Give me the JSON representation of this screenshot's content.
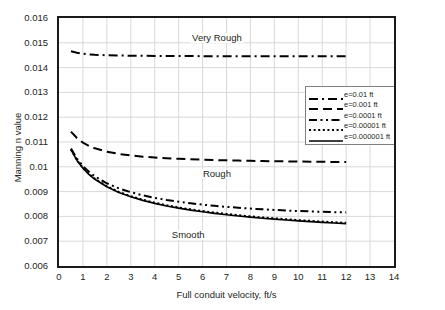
{
  "chart_data": {
    "type": "line",
    "title": "",
    "xlabel": "Full conduit velocity, ft/s",
    "ylabel": "Manning n value",
    "xlim": [
      0,
      14
    ],
    "ylim": [
      0.006,
      0.016
    ],
    "xticks": [
      "0",
      "1",
      "2",
      "3",
      "4",
      "5",
      "6",
      "7",
      "8",
      "9",
      "10",
      "11",
      "12",
      "13",
      "14"
    ],
    "yticks": [
      "0.006",
      "0.007",
      "0.008",
      "0.009",
      "0.01",
      "0.011",
      "0.012",
      "0.013",
      "0.014",
      "0.015",
      "0.016"
    ],
    "grid": "both-light-gray",
    "legend_position": "inside-upper-right",
    "x": [
      0.5,
      0.75,
      1.0,
      1.25,
      1.5,
      2.0,
      2.5,
      3.0,
      3.5,
      4.0,
      4.5,
      5.0,
      5.5,
      6.0,
      6.5,
      7.0,
      7.5,
      8.0,
      8.5,
      9.0,
      9.5,
      10.0,
      10.5,
      11.0,
      11.5,
      12.0
    ],
    "series": [
      {
        "name": "e=0.01 ft",
        "style": "dash-dot",
        "color": "#000000",
        "width": 2.0,
        "values": [
          0.01466,
          0.0146,
          0.01456,
          0.014535,
          0.014518,
          0.014498,
          0.014487,
          0.01448,
          0.014475,
          0.014471,
          0.014468,
          0.014466,
          0.014464,
          0.014462,
          0.014461,
          0.01446,
          0.014459,
          0.014458,
          0.014457,
          0.014456,
          0.014456,
          0.014455,
          0.014455,
          0.014454,
          0.014454,
          0.014453
        ]
      },
      {
        "name": "e=0.001 ft",
        "style": "dash",
        "color": "#000000",
        "width": 2.0,
        "values": [
          0.01142,
          0.01116,
          0.010975,
          0.010845,
          0.010745,
          0.01061,
          0.01052,
          0.010456,
          0.01041,
          0.010374,
          0.010345,
          0.010322,
          0.010302,
          0.010286,
          0.010272,
          0.01026,
          0.010249,
          0.01024,
          0.010232,
          0.010225,
          0.010218,
          0.010212,
          0.010206,
          0.010201,
          0.010197,
          0.010193
        ]
      },
      {
        "name": "e=0.0001 ft",
        "style": "dash-dot-dot",
        "color": "#000000",
        "width": 2.0,
        "values": [
          0.01074,
          0.01033,
          0.01003,
          0.0098,
          0.009615,
          0.009335,
          0.00913,
          0.008975,
          0.00885,
          0.008748,
          0.008662,
          0.00859,
          0.008528,
          0.008474,
          0.008427,
          0.008385,
          0.008348,
          0.008315,
          0.008286,
          0.00826,
          0.008237,
          0.008217,
          0.0082,
          0.008185,
          0.008172,
          0.008162
        ]
      },
      {
        "name": "e=0.00001 ft",
        "style": "dot",
        "color": "#000000",
        "width": 2.0,
        "values": [
          0.0107,
          0.01027,
          0.009955,
          0.009712,
          0.009515,
          0.009215,
          0.00899,
          0.008815,
          0.008672,
          0.008552,
          0.00845,
          0.008362,
          0.008284,
          0.008215,
          0.008154,
          0.008098,
          0.008048,
          0.008002,
          0.00796,
          0.007921,
          0.007885,
          0.007852,
          0.007821,
          0.007792,
          0.007765,
          0.00774
        ]
      },
      {
        "name": "e=0.000001 ft",
        "style": "solid",
        "color": "#000000",
        "width": 1.6,
        "values": [
          0.01069,
          0.010258,
          0.00994,
          0.009696,
          0.009497,
          0.009194,
          0.008967,
          0.00879,
          0.008646,
          0.008525,
          0.008422,
          0.008333,
          0.008254,
          0.008185,
          0.008123,
          0.008067,
          0.008016,
          0.00797,
          0.007928,
          0.007889,
          0.007853,
          0.007819,
          0.007788,
          0.007759,
          0.007732,
          0.007707
        ]
      }
    ],
    "annotations": [
      {
        "text": "Very Rough",
        "x": 6.6,
        "y": 0.0152
      },
      {
        "text": "Rough",
        "x": 6.6,
        "y": 0.00972
      },
      {
        "text": "Smooth",
        "x": 5.4,
        "y": 0.00723
      }
    ]
  }
}
